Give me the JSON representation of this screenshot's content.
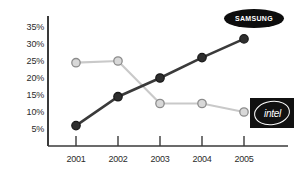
{
  "chart_data": {
    "type": "line",
    "title": "",
    "xlabel": "",
    "ylabel": "",
    "categories": [
      "2001",
      "2002",
      "2003",
      "2004",
      "2005"
    ],
    "ylim": [
      0,
      37
    ],
    "yticks": [
      "5%",
      "10%",
      "15%",
      "20%",
      "25%",
      "30%",
      "35%"
    ],
    "ytick_values": [
      5,
      10,
      15,
      20,
      25,
      30,
      35
    ],
    "grid": false,
    "legend_position": "inline-labels",
    "series": [
      {
        "name": "SAMSUNG",
        "values": [
          6,
          14.5,
          20,
          26,
          31.5
        ],
        "color": "#333333",
        "marker": "filled-circle",
        "marker_fill": "#2e2e2e",
        "marker_edge": "#1a1a1a"
      },
      {
        "name": "intel",
        "values": [
          24.5,
          25,
          12.5,
          12.5,
          10
        ],
        "color": "#c9c9c9",
        "marker": "hollow-circle",
        "marker_fill": "#d8d8d8",
        "marker_edge": "#8c8c8c"
      }
    ],
    "annotations": [
      {
        "id": "samsung-logo",
        "text": "SAMSUNG",
        "shape": "ellipse",
        "bg": "#0d0d0d",
        "fg": "#ffffff"
      },
      {
        "id": "intel-logo",
        "text": "intel",
        "shape": "square",
        "bg": "#111111",
        "fg": "#ffffff"
      }
    ],
    "axis_color": "#3a3a3a"
  }
}
